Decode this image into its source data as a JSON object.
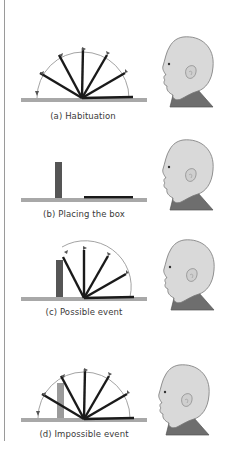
{
  "figure": {
    "panels": [
      {
        "id": "a",
        "caption": "(a) Habituation",
        "box": "none",
        "screen": "full-rotation"
      },
      {
        "id": "b",
        "caption": "(b) Placing the box",
        "box": "solid",
        "screen": "flat"
      },
      {
        "id": "c",
        "caption": "(c) Possible event",
        "box": "solid",
        "screen": "stops-at-box"
      },
      {
        "id": "d",
        "caption": "(d) Impossible event",
        "box": "faded",
        "screen": "full-rotation"
      }
    ],
    "colors": {
      "floor": "#a8a8a8",
      "screen": "#1a1a1a",
      "box": "#555555",
      "box_faded": "#8a8a8a",
      "arc": "#8c8c8c",
      "face": "#d9d9d9",
      "shirt": "#6e6e6e"
    }
  }
}
